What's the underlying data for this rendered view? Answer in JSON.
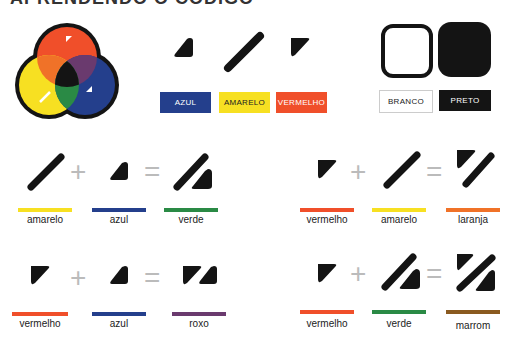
{
  "title": "APRENDENDO O CÓDIGO",
  "colors": {
    "azul": "#243f8c",
    "amarelo": "#f7e022",
    "vermelho": "#f04f2a",
    "verde": "#2a8a45",
    "laranja": "#f07228",
    "roxo": "#6a3a6e",
    "marrom": "#8a5a20",
    "preto": "#141414"
  },
  "legend": {
    "swatches": [
      {
        "label": "AZUL"
      },
      {
        "label": "AMARELO"
      },
      {
        "label": "VERMELHO"
      },
      {
        "label": "BRANCO"
      },
      {
        "label": "PRETO"
      }
    ]
  },
  "equations": [
    {
      "a": "amarelo",
      "b": "azul",
      "result": "verde"
    },
    {
      "a": "vermelho",
      "b": "amarelo",
      "result": "laranja"
    },
    {
      "a": "vermelho",
      "b": "azul",
      "result": "roxo"
    },
    {
      "a": "vermelho",
      "b": "verde",
      "result": "marrom"
    }
  ],
  "operators": {
    "plus": "+",
    "equals": "="
  }
}
